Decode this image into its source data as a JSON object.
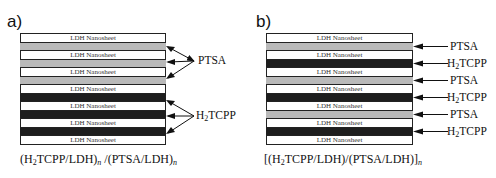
{
  "panel_a": {
    "label": "a)",
    "sheet_label": "LDH Nanosheet",
    "layers": [
      "sheet",
      "ptsa",
      "sheet",
      "ptsa",
      "sheet",
      "ptsa",
      "sheet",
      "tcpp",
      "sheet",
      "tcpp",
      "sheet",
      "tcpp",
      "sheet"
    ],
    "annotations": {
      "ptsa": "PTSA",
      "tcpp_prefix": "H",
      "tcpp_sub": "2",
      "tcpp_suffix": "TCPP"
    },
    "formula": {
      "p1": "(H",
      "s1": "2",
      "p2": "TCPP/LDH)",
      "s2": "n",
      "p3": " /(PTSA/LDH)",
      "s3": "n"
    }
  },
  "panel_b": {
    "label": "b)",
    "sheet_label": "LDH Nanosheet",
    "layers": [
      "sheet",
      "ptsa",
      "sheet",
      "tcpp",
      "sheet",
      "ptsa",
      "sheet",
      "tcpp",
      "sheet",
      "ptsa",
      "sheet",
      "tcpp",
      "sheet"
    ],
    "annotations": {
      "ptsa": "PTSA",
      "tcpp_prefix": "H",
      "tcpp_sub": "2",
      "tcpp_suffix": "TCPP"
    },
    "formula": {
      "p1": "[(H",
      "s1": "2",
      "p2": "TCPP/LDH)/(PTSA/LDH)]",
      "s2": "n"
    }
  },
  "colors": {
    "ptsa": "#b9b9b9",
    "tcpp": "#1e1e1e",
    "sheet": "#ffffff"
  }
}
